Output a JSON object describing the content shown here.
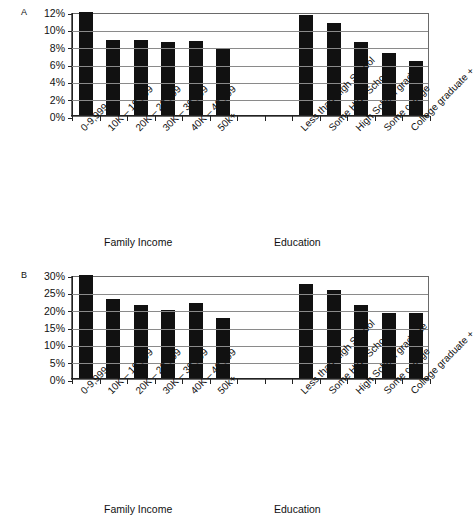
{
  "figure": {
    "panels": [
      {
        "label": "A",
        "group_titles": {
          "income": "Family Income",
          "education": "Education"
        }
      },
      {
        "label": "B",
        "group_titles": {
          "income": "Family Income",
          "education": "Education"
        }
      }
    ]
  },
  "chart_data": [
    {
      "type": "bar",
      "panel": "A",
      "title": "",
      "xlabel": "",
      "ylabel": "",
      "ylim": [
        0,
        12
      ],
      "yticks": [
        "0%",
        "2%",
        "4%",
        "6%",
        "8%",
        "10%",
        "12%"
      ],
      "ytick_values": [
        0,
        2,
        4,
        6,
        8,
        10,
        12
      ],
      "grid": true,
      "legend": "none",
      "groups": [
        {
          "name": "Family Income",
          "categories": [
            "0-9,999",
            "10K – 19,999",
            "20K – 29,999",
            "30K – 39,999",
            "40K – 49,999",
            "50k+"
          ],
          "values": [
            12.0,
            8.8,
            8.8,
            8.5,
            8.6,
            7.7
          ]
        },
        {
          "name": "Education",
          "categories": [
            "Less than High School",
            "Some High School",
            "High School grad",
            "Some college",
            "College graduate +"
          ],
          "values": [
            11.6,
            10.7,
            8.5,
            7.3,
            6.3
          ]
        }
      ]
    },
    {
      "type": "bar",
      "panel": "B",
      "title": "",
      "xlabel": "",
      "ylabel": "",
      "ylim": [
        0,
        30
      ],
      "yticks": [
        "0%",
        "5%",
        "10%",
        "15%",
        "20%",
        "25%",
        "30%"
      ],
      "ytick_values": [
        0,
        5,
        10,
        15,
        20,
        25,
        30
      ],
      "grid": true,
      "legend": "none",
      "groups": [
        {
          "name": "Family Income",
          "categories": [
            "0-9,999",
            "10K – 19,999",
            "20K – 29,999",
            "30K – 39,999",
            "40K – 49,999",
            "50k+"
          ],
          "values": [
            30.0,
            23.0,
            21.3,
            20.0,
            21.8,
            17.5
          ]
        },
        {
          "name": "Education",
          "categories": [
            "Less than High School",
            "Some High School",
            "High School graduate",
            "Some college",
            "College graduate +"
          ],
          "values": [
            27.5,
            25.6,
            21.3,
            19.0,
            19.0
          ]
        }
      ]
    }
  ]
}
